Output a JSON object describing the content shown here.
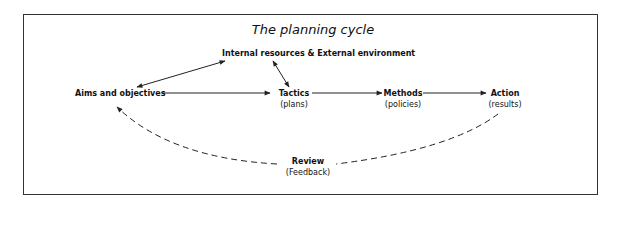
{
  "title": "The planning cycle",
  "nodes": {
    "resources": {
      "label": "Internal resources & External environment"
    },
    "aims": {
      "label": "Aims and objectives"
    },
    "tactics": {
      "label": "Tactics",
      "sub": "(plans)"
    },
    "methods": {
      "label": "Methods",
      "sub": "(policies)"
    },
    "action": {
      "label": "Action",
      "sub": "(results)"
    },
    "review": {
      "label": "Review",
      "sub": "(Feedback)"
    }
  },
  "edges": [
    {
      "from": "aims",
      "to": "resources",
      "style": "solid",
      "direction": "both"
    },
    {
      "from": "resources",
      "to": "tactics",
      "style": "solid",
      "direction": "both"
    },
    {
      "from": "aims",
      "to": "tactics",
      "style": "solid",
      "direction": "forward"
    },
    {
      "from": "tactics",
      "to": "methods",
      "style": "solid",
      "direction": "forward"
    },
    {
      "from": "methods",
      "to": "action",
      "style": "solid",
      "direction": "forward"
    },
    {
      "from": "action",
      "to": "aims",
      "via": "review",
      "style": "dashed",
      "direction": "forward"
    }
  ],
  "colors": {
    "line": "#222222",
    "text": "#111111",
    "background": "#ffffff"
  }
}
